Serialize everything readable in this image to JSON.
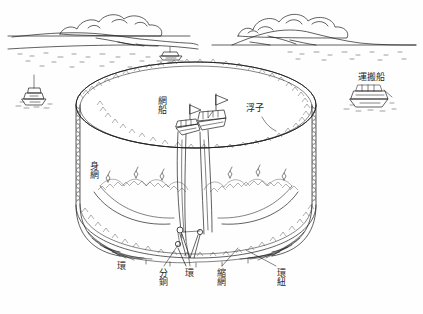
{
  "figure": {
    "background_color": "#fefefe",
    "ink_color": "#1d1d1d",
    "width": 423,
    "height": 314
  },
  "labels": {
    "ami_bune": "網船",
    "uki": "浮子",
    "unpansen": "運搬船",
    "mi_ami": "身網",
    "kan_left": "環",
    "fundou": "分銅",
    "kan_center": "環",
    "shuku_ami": "縮網",
    "kan_himo": "環紐"
  },
  "scene": {
    "sky": "clouds-over-horizon",
    "horizon": "coastline-with-hills",
    "water": "sea-surface-stipple",
    "boats": [
      {
        "name": "boat-left-background",
        "label": ""
      },
      {
        "name": "boat-horizon-center",
        "label": ""
      },
      {
        "name": "boat-carrier-right",
        "label": "運搬船"
      },
      {
        "name": "net-boat-inner-left",
        "label": "網船"
      },
      {
        "name": "net-boat-inner-right",
        "label": ""
      }
    ],
    "net": {
      "name": "purse-seine-net",
      "parts": [
        "浮子",
        "身網",
        "縮網",
        "環",
        "環紐",
        "分銅"
      ]
    }
  }
}
